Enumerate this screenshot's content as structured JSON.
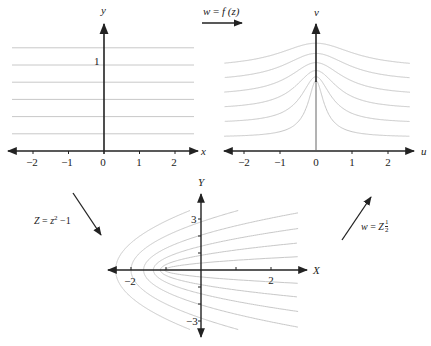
{
  "colors": {
    "axis": "#222222",
    "curve": "#c8c8c8",
    "background": "#ffffff"
  },
  "top_left": {
    "x_label": "x",
    "y_label": "y",
    "y_tick_label": "1",
    "x_ticks": [
      "−2",
      "−1",
      "0",
      "1",
      "2"
    ],
    "horizontal_lines_y": [
      0.2,
      0.4,
      0.6,
      0.8,
      1.0,
      1.2
    ]
  },
  "top_arrow": {
    "label_lhs": "w",
    "label_eq": " = ",
    "label_rhs": "f (z)"
  },
  "top_right": {
    "x_label": "u",
    "y_label": "v",
    "x_ticks": [
      "−2",
      "−1",
      "0",
      "1",
      "2"
    ],
    "curve_params_c": [
      0.2,
      0.4,
      0.6,
      0.8,
      1.0,
      1.2
    ],
    "mapping": "w = sqrt(z^2 - 1)"
  },
  "left_arrow": {
    "label_Z": "Z",
    "label_eq": " = ",
    "label_z": "z",
    "label_exp": "2",
    "label_tail": " −1"
  },
  "right_arrow": {
    "label_w": "w",
    "label_eq": " = ",
    "label_Z": "Z",
    "label_num": "1",
    "label_den": "2"
  },
  "bottom": {
    "x_label": "X",
    "y_label": "Y",
    "x_tick_neg": "−2",
    "x_tick_pos": "2",
    "y_tick_pos": "3",
    "y_tick_neg": "−3",
    "parabola_params_c": [
      0.2,
      0.4,
      0.6,
      0.8,
      1.0,
      1.2
    ]
  }
}
